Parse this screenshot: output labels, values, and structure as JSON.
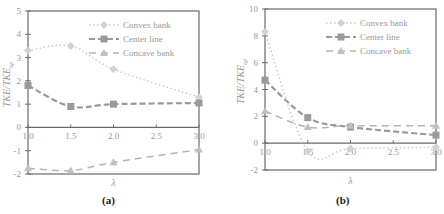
{
  "chart_data": [
    {
      "id": "a",
      "type": "line",
      "caption": "(a)",
      "title": "",
      "xlabel": "λ",
      "ylabel": "TKE/TKE_up",
      "x": [
        1.0,
        1.5,
        2.0,
        3.0
      ],
      "xticks": [
        "1.0",
        "1.5",
        "2.0",
        "2.5",
        "3.0"
      ],
      "xlim": [
        1.0,
        3.0
      ],
      "ylim": [
        -2,
        5
      ],
      "yticks": [
        "5",
        "4",
        "3",
        "2",
        "1",
        "0",
        "-1",
        "-2"
      ],
      "legend_position": "upper right",
      "grid": false,
      "series": [
        {
          "name": "Convex bank",
          "style": "dotted",
          "marker": "diamond",
          "values": [
            3.3,
            3.5,
            2.5,
            1.3
          ]
        },
        {
          "name": "Center line",
          "style": "dashed-bold",
          "marker": "square",
          "values": [
            1.8,
            0.9,
            1.0,
            1.05
          ]
        },
        {
          "name": "Concave bank",
          "style": "dashed",
          "marker": "triangle",
          "values": [
            -1.75,
            -1.85,
            -1.5,
            -0.95
          ]
        }
      ]
    },
    {
      "id": "b",
      "type": "line",
      "caption": "(b)",
      "title": "",
      "xlabel": "λ",
      "ylabel": "TKE/TKE_up",
      "x": [
        1.0,
        1.5,
        2.0,
        3.0
      ],
      "xticks": [
        "1.0",
        "1.5",
        "2.0",
        "2.5",
        "3.0"
      ],
      "xlim": [
        1.0,
        3.0
      ],
      "ylim": [
        -2,
        10
      ],
      "yticks": [
        "10",
        "8",
        "6",
        "4",
        "2",
        "0",
        "-2"
      ],
      "legend_position": "upper right",
      "grid": false,
      "series": [
        {
          "name": "Convex bank",
          "style": "dotted",
          "marker": "diamond",
          "values": [
            8.3,
            -0.6,
            -0.4,
            -0.3
          ]
        },
        {
          "name": "Center line",
          "style": "dashed-bold",
          "marker": "square",
          "values": [
            4.7,
            1.9,
            1.2,
            0.6
          ]
        },
        {
          "name": "Concave bank",
          "style": "dashed",
          "marker": "triangle",
          "values": [
            2.4,
            1.2,
            1.3,
            1.3
          ]
        }
      ]
    }
  ]
}
